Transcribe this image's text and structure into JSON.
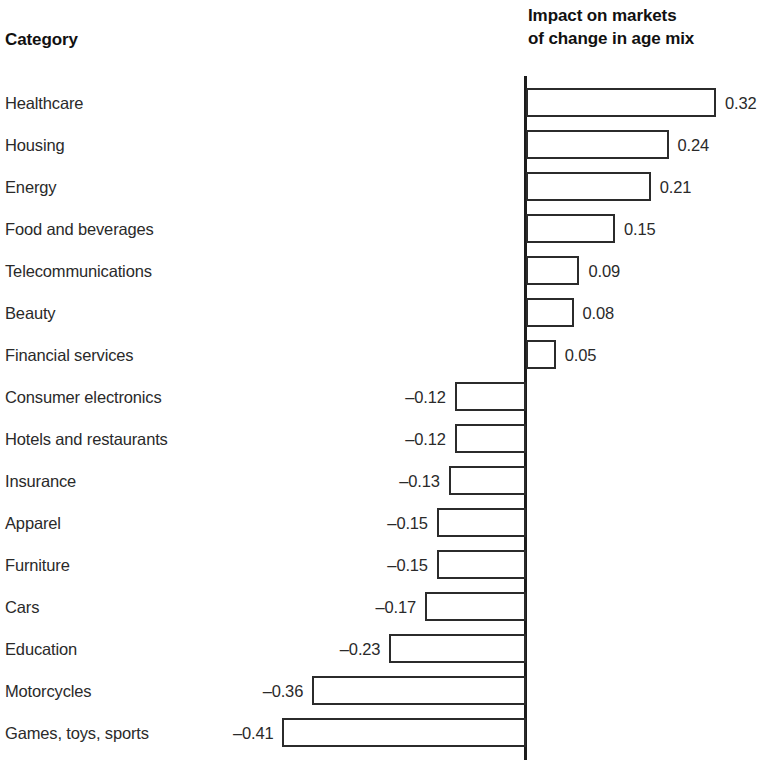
{
  "header": {
    "category_label": "Category",
    "value_label_line1": "Impact on markets",
    "value_label_line2": "of change in age mix"
  },
  "chart_data": {
    "type": "bar",
    "orientation": "horizontal",
    "title": "Impact on markets of change in age mix",
    "xlabel": "Impact on markets of change in age mix",
    "ylabel": "Category",
    "grid": false,
    "legend": null,
    "xlim": [
      -0.45,
      0.36
    ],
    "zero_axis": true,
    "categories": [
      "Healthcare",
      "Housing",
      "Energy",
      "Food and beverages",
      "Telecommunications",
      "Beauty",
      "Financial services",
      "Consumer electronics",
      "Hotels and restaurants",
      "Insurance",
      "Apparel",
      "Furniture",
      "Cars",
      "Education",
      "Motorcycles",
      "Games, toys, sports"
    ],
    "values": [
      0.32,
      0.24,
      0.21,
      0.15,
      0.09,
      0.08,
      0.05,
      -0.12,
      -0.12,
      -0.13,
      -0.15,
      -0.15,
      -0.17,
      -0.23,
      -0.36,
      -0.41
    ],
    "value_labels": [
      "0.32",
      "0.24",
      "0.21",
      "0.15",
      "0.09",
      "0.08",
      "0.05",
      "–0.12",
      "–0.12",
      "–0.13",
      "–0.15",
      "–0.15",
      "–0.17",
      "–0.23",
      "–0.36",
      "–0.41"
    ],
    "colors": {
      "bar_fill": "#ffffff",
      "bar_stroke": "#2b2b2b",
      "axis": "#1c1c1c",
      "text": "#2a2a2a",
      "header_text": "#111111",
      "background": "#ffffff"
    }
  }
}
